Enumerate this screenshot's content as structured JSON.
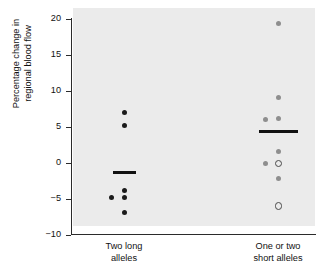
{
  "chart_data": {
    "type": "scatter",
    "title": "",
    "xlabel": "",
    "ylabel": "Percentage change in\nregional blood flow",
    "ylim": [
      -10,
      20
    ],
    "yticks": [
      20,
      15,
      10,
      5,
      0,
      -5,
      -10
    ],
    "ytick_labels": [
      "20",
      "15",
      "10",
      "5",
      "0",
      "−5",
      "−10"
    ],
    "grid": false,
    "legend": "none",
    "panel_background": "#ebebeb",
    "categories": [
      "Two long\nalleles",
      "One or two\nshort alleles"
    ],
    "series": [
      {
        "name": "Two long alleles",
        "category": "Two long\nalleles",
        "mean": -1.4,
        "points": [
          {
            "value": 7.0,
            "marker": "filled",
            "jitter": 0
          },
          {
            "value": 5.2,
            "marker": "filled",
            "jitter": 0
          },
          {
            "value": -3.9,
            "marker": "filled",
            "jitter": 0
          },
          {
            "value": -4.9,
            "marker": "filled",
            "jitter": 0
          },
          {
            "value": -4.9,
            "marker": "filled",
            "jitter": -13
          },
          {
            "value": -6.9,
            "marker": "filled",
            "jitter": 0
          }
        ]
      },
      {
        "name": "One or two short alleles",
        "category": "One or two\nshort alleles",
        "mean": 4.3,
        "points": [
          {
            "value": 19.3,
            "marker": "filled",
            "jitter": 0
          },
          {
            "value": 9.1,
            "marker": "filled",
            "jitter": 0
          },
          {
            "value": 6.1,
            "marker": "filled",
            "jitter": 0
          },
          {
            "value": 6.0,
            "marker": "filled",
            "jitter": -13
          },
          {
            "value": 1.5,
            "marker": "filled",
            "jitter": 0
          },
          {
            "value": -0.1,
            "marker": "open",
            "jitter": 0
          },
          {
            "value": -0.2,
            "marker": "filled",
            "jitter": -13
          },
          {
            "value": -2.2,
            "marker": "filled",
            "jitter": 0
          },
          {
            "value": -6.0,
            "marker": "open",
            "jitter": 0
          }
        ]
      }
    ]
  }
}
